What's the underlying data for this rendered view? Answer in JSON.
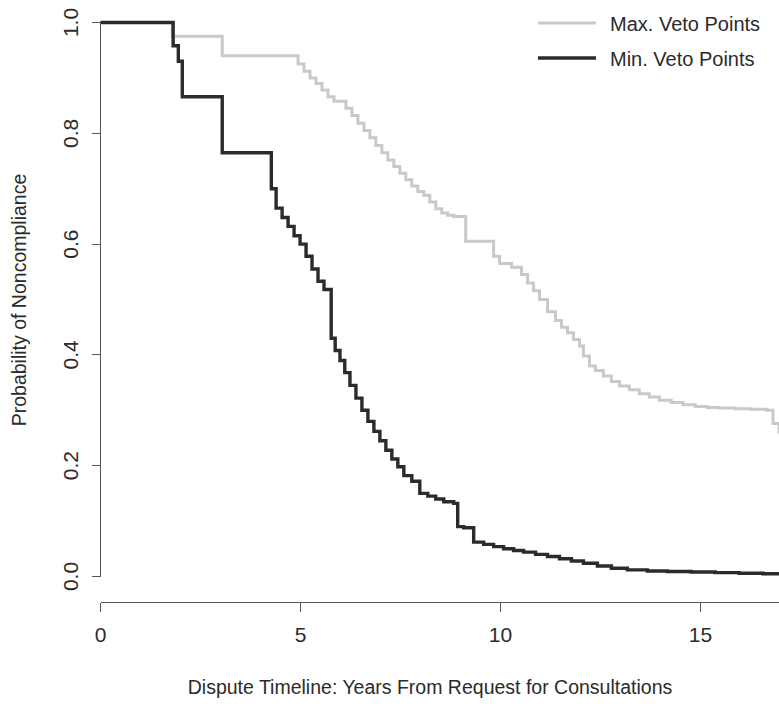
{
  "chart_data": {
    "type": "line",
    "subtype": "kaplan-meier-step",
    "title": "",
    "xlabel": "Dispute Timeline: Years From Request for Consultations",
    "ylabel": "Probability of Noncompliance",
    "xlim": [
      0,
      17.0
    ],
    "ylim": [
      0.0,
      1.0
    ],
    "grid": false,
    "xticks": [
      0,
      5,
      10,
      15
    ],
    "xtick_labels": [
      "0",
      "5",
      "10",
      "15"
    ],
    "yticks": [
      0.0,
      0.2,
      0.4,
      0.6,
      0.8,
      1.0
    ],
    "ytick_labels": [
      "0.0",
      "0.2",
      "0.4",
      "0.6",
      "0.8",
      "1.0"
    ],
    "legend": {
      "position": "top-right",
      "entries": [
        {
          "name": "Max. Veto Points",
          "color": "#c9c9c9",
          "width": 3.0
        },
        {
          "name": "Min. Veto Points",
          "color": "#2b2b2b",
          "width": 3.4
        }
      ]
    },
    "series": [
      {
        "name": "Max. Veto Points",
        "color": "#c9c9c9",
        "width": 3.0,
        "step": "post",
        "x": [
          0.0,
          1.75,
          1.8,
          2.0,
          2.95,
          3.05,
          4.8,
          4.95,
          5.1,
          5.25,
          5.4,
          5.55,
          5.7,
          5.85,
          6.0,
          6.15,
          6.3,
          6.45,
          6.6,
          6.75,
          6.9,
          7.05,
          7.2,
          7.35,
          7.5,
          7.65,
          7.8,
          7.95,
          8.1,
          8.25,
          8.4,
          8.55,
          8.7,
          8.85,
          9.0,
          9.15,
          9.7,
          9.85,
          10.0,
          10.3,
          10.55,
          10.7,
          10.85,
          11.0,
          11.2,
          11.4,
          11.55,
          11.7,
          11.85,
          12.0,
          12.1,
          12.25,
          12.4,
          12.6,
          12.8,
          13.0,
          13.25,
          13.5,
          13.75,
          14.0,
          14.3,
          14.6,
          14.9,
          15.2,
          15.5,
          15.9,
          16.3,
          16.7,
          16.85,
          17.0
        ],
        "y": [
          1.0,
          1.0,
          0.975,
          0.975,
          0.975,
          0.94,
          0.94,
          0.925,
          0.912,
          0.9,
          0.89,
          0.878,
          0.866,
          0.858,
          0.858,
          0.845,
          0.832,
          0.818,
          0.805,
          0.792,
          0.778,
          0.765,
          0.752,
          0.74,
          0.728,
          0.716,
          0.705,
          0.695,
          0.688,
          0.676,
          0.664,
          0.656,
          0.652,
          0.65,
          0.65,
          0.605,
          0.605,
          0.578,
          0.565,
          0.558,
          0.545,
          0.53,
          0.516,
          0.5,
          0.478,
          0.462,
          0.45,
          0.44,
          0.428,
          0.416,
          0.398,
          0.38,
          0.372,
          0.362,
          0.352,
          0.344,
          0.337,
          0.33,
          0.324,
          0.318,
          0.314,
          0.31,
          0.307,
          0.305,
          0.304,
          0.303,
          0.302,
          0.3,
          0.276,
          0.258
        ]
      },
      {
        "name": "Min. Veto Points",
        "color": "#2b2b2b",
        "width": 3.4,
        "step": "post",
        "x": [
          0.0,
          1.75,
          1.82,
          1.95,
          2.05,
          3.0,
          3.05,
          4.2,
          4.28,
          4.4,
          4.55,
          4.7,
          4.85,
          5.0,
          5.15,
          5.3,
          5.45,
          5.6,
          5.7,
          5.78,
          5.88,
          6.0,
          6.12,
          6.25,
          6.4,
          6.55,
          6.7,
          6.85,
          7.0,
          7.15,
          7.3,
          7.45,
          7.6,
          7.8,
          8.0,
          8.2,
          8.4,
          8.6,
          8.85,
          8.95,
          9.1,
          9.35,
          9.6,
          9.85,
          10.1,
          10.35,
          10.6,
          10.9,
          11.2,
          11.5,
          11.8,
          12.1,
          12.45,
          12.8,
          13.2,
          13.7,
          14.2,
          14.8,
          15.4,
          16.0,
          16.6,
          17.0
        ],
        "y": [
          1.0,
          1.0,
          0.958,
          0.93,
          0.866,
          0.866,
          0.765,
          0.765,
          0.7,
          0.665,
          0.648,
          0.632,
          0.615,
          0.6,
          0.578,
          0.555,
          0.533,
          0.518,
          0.518,
          0.43,
          0.408,
          0.39,
          0.368,
          0.345,
          0.322,
          0.3,
          0.28,
          0.262,
          0.245,
          0.228,
          0.212,
          0.198,
          0.182,
          0.172,
          0.15,
          0.145,
          0.14,
          0.135,
          0.132,
          0.09,
          0.088,
          0.062,
          0.058,
          0.054,
          0.05,
          0.047,
          0.044,
          0.04,
          0.036,
          0.032,
          0.028,
          0.024,
          0.019,
          0.015,
          0.012,
          0.01,
          0.009,
          0.008,
          0.007,
          0.006,
          0.005,
          0.005
        ]
      }
    ]
  },
  "axis": {
    "x_label": "Dispute Timeline: Years From Request for Consultations",
    "y_label": "Probability of Noncompliance",
    "x_tick_labels": [
      "0",
      "5",
      "10",
      "15"
    ],
    "y_tick_labels": [
      "0.0",
      "0.2",
      "0.4",
      "0.6",
      "0.8",
      "1.0"
    ]
  },
  "legend": {
    "max_label": "Max. Veto Points",
    "min_label": "Min. Veto Points"
  },
  "colors": {
    "max_series": "#c9c9c9",
    "min_series": "#2b2b2b",
    "axis": "#555555",
    "text": "#2b2b2b",
    "background": "#ffffff"
  }
}
